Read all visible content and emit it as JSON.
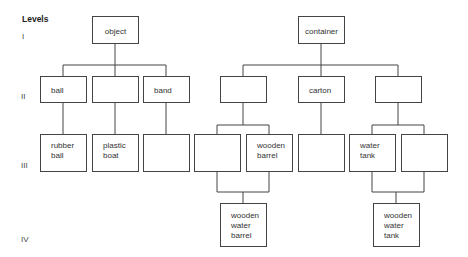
{
  "legend": {
    "title": "Levels",
    "levels": [
      "I",
      "II",
      "III",
      "IV"
    ]
  },
  "trees": [
    {
      "root": "object",
      "level2": [
        "ball",
        "",
        "band"
      ],
      "level3": [
        "rubber\nball",
        "plastic\nboat",
        ""
      ]
    },
    {
      "root": "container",
      "level2": [
        "",
        "carton",
        ""
      ],
      "level3": [
        "",
        "wooden\nbarrel",
        "",
        "water\ntank",
        ""
      ],
      "level4": [
        "wooden\nwater\nbarrel",
        "wooden\nwater\ntank"
      ]
    }
  ]
}
